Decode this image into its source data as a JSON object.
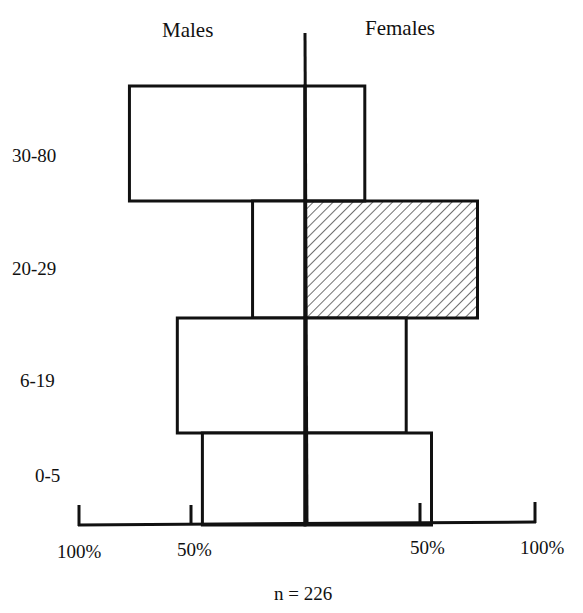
{
  "chart_data": {
    "type": "bar",
    "subtype": "population-pyramid",
    "title": "",
    "left_series_label": "Males",
    "right_series_label": "Females",
    "categories": [
      "30-80",
      "20-29",
      "6-19",
      "0-5"
    ],
    "series": [
      {
        "name": "Males",
        "values": [
          77,
          23,
          56,
          45
        ]
      },
      {
        "name": "Females",
        "values": [
          26,
          75,
          44,
          55
        ]
      }
    ],
    "highlighted": {
      "series": "Females",
      "category": "20-29",
      "pattern": "diagonal-hatch"
    },
    "x_ticks_left": [
      "100%",
      "50%"
    ],
    "x_ticks_right": [
      "50%",
      "100%"
    ],
    "xlim": [
      -100,
      100
    ],
    "grid": false,
    "annotation": "n = 226",
    "xlabel": "",
    "ylabel": ""
  },
  "labels": {
    "males": "Males",
    "females": "Females",
    "cat0": "30-80",
    "cat1": "20-29",
    "cat2": "6-19",
    "cat3": "0-5",
    "tick_l100": "100%",
    "tick_l50": "50%",
    "tick_r50": "50%",
    "tick_r100": "100%",
    "n": "n = 226"
  }
}
